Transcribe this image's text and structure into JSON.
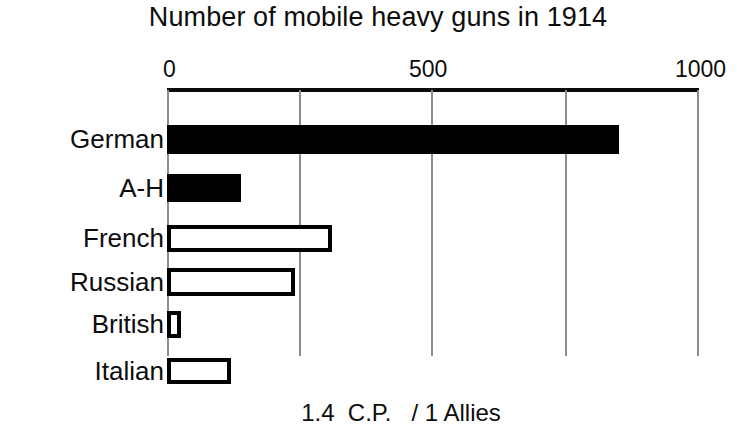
{
  "chart_data": {
    "type": "bar",
    "orientation": "horizontal",
    "title": "Number of mobile heavy guns in 1914",
    "xlabel": "",
    "ylabel": "",
    "xlim": [
      0,
      1000
    ],
    "grid": true,
    "axis_position": "top",
    "legend": "none",
    "categories": [
      "German",
      "A-H",
      "French",
      "Russian",
      "British",
      "Italian"
    ],
    "values": [
      850,
      140,
      310,
      240,
      26,
      120
    ],
    "tick_values": [
      0,
      500,
      1000
    ],
    "tick_labels": [
      "0",
      "500",
      "1000"
    ],
    "gridline_values": [
      0,
      250,
      500,
      750,
      1000
    ],
    "bar_styles": [
      "filled",
      "filled",
      "hollow",
      "hollow",
      "hollow",
      "hollow"
    ],
    "annotation": "1.4  C.P.   / 1 Allies",
    "colors": {
      "filled": "#000000",
      "hollow_fill": "#ffffff",
      "outline": "#000000",
      "axis": "#0a0a0a",
      "gridline": "#8d8d8d",
      "text": "#0d0d0d",
      "background": "#ffffff"
    }
  },
  "title": {
    "text": "Number of mobile heavy guns in 1914"
  },
  "axis": {
    "ticks": [
      {
        "label": "0"
      },
      {
        "label": "500"
      },
      {
        "label": "1000"
      }
    ]
  },
  "bars": [
    {
      "label": "German",
      "value": 850,
      "style": "filled"
    },
    {
      "label": "A-H",
      "value": 140,
      "style": "filled"
    },
    {
      "label": "French",
      "value": 310,
      "style": "hollow"
    },
    {
      "label": "Russian",
      "value": 240,
      "style": "hollow"
    },
    {
      "label": "British",
      "value": 26,
      "style": "hollow"
    },
    {
      "label": "Italian",
      "value": 120,
      "style": "hollow"
    }
  ],
  "footnote": {
    "text": "1.4  C.P.   / 1 Allies"
  }
}
